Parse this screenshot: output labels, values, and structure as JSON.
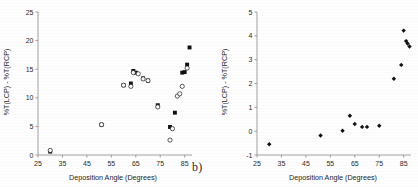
{
  "figure": {
    "subfigure_label": "b)",
    "background_color": "#fefefe",
    "point_color": "#111111"
  },
  "chart_data": [
    {
      "panel": "left",
      "type": "scatter",
      "title": "",
      "xlabel": "Deposition Angle (Degrees)",
      "ylabel": "%T(LCP) - %T(RCP)",
      "xlim": [
        25,
        88
      ],
      "ylim": [
        0,
        25
      ],
      "xticks": [
        25,
        35,
        45,
        55,
        65,
        75,
        85
      ],
      "yticks": [
        0,
        5,
        10,
        15,
        20,
        25
      ],
      "grid": false,
      "legend": "none",
      "series": [
        {
          "name": "filled",
          "marker": "filled-square",
          "points": [
            [
              30,
              0.6
            ],
            [
              51,
              5.3
            ],
            [
              60,
              12.2
            ],
            [
              63,
              12.5
            ],
            [
              64,
              14.7
            ],
            [
              65,
              14.4
            ],
            [
              68,
              13.4
            ],
            [
              70,
              13.0
            ],
            [
              74,
              8.7
            ],
            [
              79,
              4.9
            ],
            [
              81,
              7.4
            ],
            [
              84,
              14.4
            ],
            [
              85,
              14.5
            ],
            [
              86,
              15.8
            ],
            [
              87,
              18.8
            ]
          ]
        },
        {
          "name": "open",
          "marker": "open-circle",
          "points": [
            [
              30,
              0.8
            ],
            [
              51,
              5.3
            ],
            [
              60,
              12.2
            ],
            [
              63,
              12.0
            ],
            [
              64,
              14.4
            ],
            [
              66,
              14.2
            ],
            [
              68,
              13.3
            ],
            [
              70,
              13.0
            ],
            [
              74,
              8.4
            ],
            [
              79,
              2.6
            ],
            [
              80,
              4.6
            ],
            [
              82,
              10.3
            ],
            [
              83,
              10.7
            ],
            [
              84,
              12.0
            ],
            [
              86,
              15.2
            ]
          ]
        }
      ]
    },
    {
      "panel": "right",
      "type": "scatter",
      "title": "",
      "xlabel": "Deposition Angle (Degrees)",
      "ylabel": "%T(LCP) - %T(RCP)",
      "xlim": [
        25,
        88
      ],
      "ylim": [
        -1,
        5
      ],
      "xticks": [
        25,
        35,
        45,
        55,
        65,
        75,
        85
      ],
      "yticks": [
        -1,
        0,
        1,
        2,
        3,
        4,
        5
      ],
      "grid": false,
      "legend": "none",
      "series": [
        {
          "name": "filled",
          "marker": "filled-diamond",
          "points": [
            [
              30,
              -0.55
            ],
            [
              51,
              -0.18
            ],
            [
              60,
              0.02
            ],
            [
              63,
              0.65
            ],
            [
              65,
              0.3
            ],
            [
              68,
              0.18
            ],
            [
              70,
              0.18
            ],
            [
              75,
              0.23
            ],
            [
              81,
              2.2
            ],
            [
              84,
              2.78
            ],
            [
              85,
              4.22
            ],
            [
              86,
              3.78
            ],
            [
              86.6,
              3.68
            ],
            [
              87.4,
              3.55
            ]
          ]
        }
      ]
    }
  ],
  "left_axis": {
    "ytick_labels": [
      "0",
      "5",
      "10",
      "15",
      "20",
      "25"
    ],
    "xtick_labels": [
      "25",
      "35",
      "45",
      "55",
      "65",
      "75",
      "85"
    ],
    "x_title": "Deposition Angle (Degrees)",
    "y_title": "%T(LCP) - %T(RCP)"
  },
  "right_axis": {
    "ytick_labels": [
      "-1",
      "0",
      "1",
      "2",
      "3",
      "4",
      "5"
    ],
    "xtick_labels": [
      "25",
      "35",
      "45",
      "55",
      "65",
      "75",
      "85"
    ],
    "x_title": "Deposition Angle (Degrees)",
    "y_title": "%T(LCP) - %T(RCP)"
  }
}
